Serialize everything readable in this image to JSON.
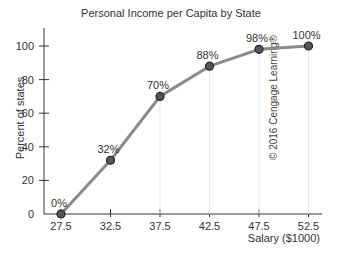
{
  "chart_data": {
    "type": "line",
    "title": "Personal Income per Capita by State",
    "xlabel": "Salary ($1000)",
    "ylabel": "Percent of states",
    "x": [
      27.5,
      32.5,
      37.5,
      42.5,
      47.5,
      52.5
    ],
    "values": [
      0,
      32,
      70,
      88,
      98,
      100
    ],
    "data_labels": [
      "0%",
      "32%",
      "70%",
      "88%",
      "98%",
      "100%"
    ],
    "x_ticks": [
      "27.5",
      "32.5",
      "37.5",
      "42.5",
      "47.5",
      "52.5"
    ],
    "y_ticks": [
      "0",
      "20",
      "40",
      "60",
      "80",
      "100"
    ],
    "ylim": [
      0,
      100
    ],
    "grid": false,
    "legend": null,
    "annotations": [
      "© 2016 Cengage Learning®"
    ],
    "colors": {
      "line": "#8a8a8a",
      "marker_fill": "#555555",
      "marker_edge": "#222222",
      "axis": "#333333"
    }
  },
  "title": "Personal Income per Capita by State",
  "axes": {
    "xlabel": "Salary ($1000)",
    "ylabel": "Percent of states",
    "x_ticks": [
      "27.5",
      "32.5",
      "37.5",
      "42.5",
      "47.5",
      "52.5"
    ],
    "y_ticks": [
      "0",
      "20",
      "40",
      "60",
      "80",
      "100"
    ]
  },
  "labels": [
    "0%",
    "32%",
    "70%",
    "88%",
    "98%",
    "100%"
  ],
  "copyright": "© 2016 Cengage Learning®"
}
